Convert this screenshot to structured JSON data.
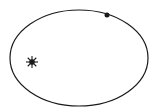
{
  "diagram": {
    "type": "elliptical-orbit",
    "background": "#ffffff",
    "stroke_color": "#1a1a1a",
    "orbit": {
      "cx": 79,
      "cy": 58,
      "rx": 69,
      "ry": 48
    },
    "star": {
      "name": "sun",
      "x": 32,
      "y": 62,
      "icon": "star-burst-icon"
    },
    "planet": {
      "name": "planet",
      "x": 107,
      "y": 15,
      "r": 2.5
    }
  }
}
